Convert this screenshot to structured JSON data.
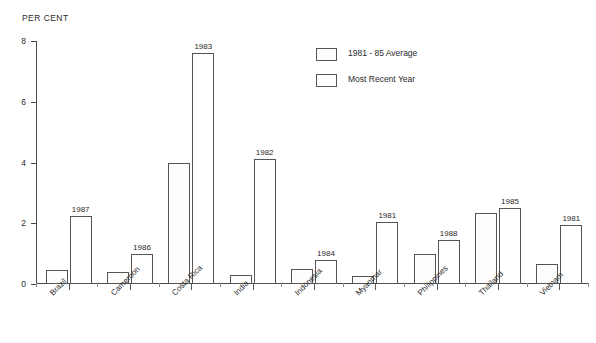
{
  "chart_data": {
    "type": "bar",
    "title": "",
    "ylabel": "PER CENT",
    "xlabel": "",
    "ylim": [
      0,
      8
    ],
    "yticks": [
      0,
      2,
      4,
      6,
      8
    ],
    "grid": false,
    "legend_position": "top-right",
    "categories": [
      "Brazil",
      "Cameroon",
      "Costa Rica",
      "India",
      "Indonesia",
      "Myanmar",
      "Philippines",
      "Thailand",
      "Vietnam"
    ],
    "series": [
      {
        "name": "1981 - 85 Average",
        "fill": "dotted",
        "values": [
          0.45,
          0.4,
          4.0,
          0.3,
          0.5,
          0.27,
          1.0,
          2.35,
          0.65
        ]
      },
      {
        "name": "Most Recent Year",
        "fill": "white",
        "values": [
          2.25,
          1.0,
          7.6,
          4.1,
          0.8,
          2.05,
          1.45,
          2.5,
          1.95
        ]
      }
    ],
    "point_labels": [
      "1987",
      "1986",
      "1983",
      "1982",
      "1984",
      "1981",
      "1988",
      "1985",
      "1981"
    ]
  },
  "legend": {
    "items": [
      {
        "label": "1981 - 85 Average",
        "swatch": "dotted"
      },
      {
        "label": "Most Recent Year",
        "swatch": "white"
      }
    ]
  },
  "colors": {
    "axis": "#4a4a4a",
    "bar_border": "#555555",
    "dot_fill": "#9a9a9a",
    "text": "#2a2a2a",
    "background": "#ffffff"
  }
}
